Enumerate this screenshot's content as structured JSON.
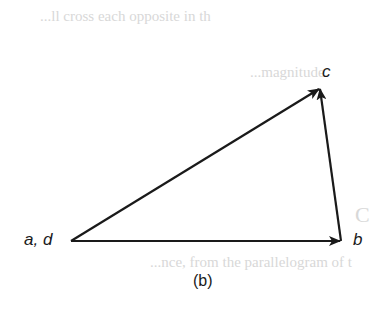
{
  "figure": {
    "caption": "(b)",
    "vertices": {
      "ad": {
        "label": "a, d",
        "x": 71,
        "y": 241
      },
      "b": {
        "label": "b",
        "x": 341,
        "y": 241
      },
      "c": {
        "label": "c",
        "x": 320,
        "y": 88
      }
    },
    "vectors": [
      {
        "from": "ad",
        "to": "b"
      },
      {
        "from": "b",
        "to": "c"
      },
      {
        "from": "ad",
        "to": "c"
      }
    ],
    "stroke_color": "#1a1a1a"
  },
  "bleed_through": {
    "line1": "...ll cross each opposite in th",
    "line2": "...magnitude",
    "line3": "C",
    "line4": "...nce, from the parallelogram of t"
  }
}
